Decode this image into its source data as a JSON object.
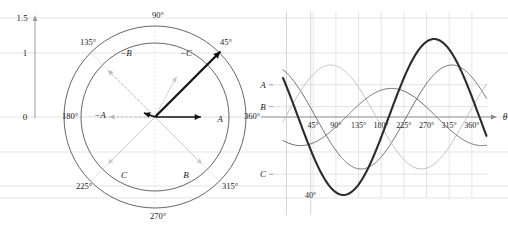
{
  "figure": {
    "title": "",
    "panels": [
      "polar-phasor-diagram",
      "waveform-plot"
    ]
  },
  "colors": {
    "axis": "#9a9a9a",
    "grid": "#d8d8d8",
    "circle": "#555555",
    "phasor_black": "#111111",
    "phasor_grey": "#bdbdbd",
    "phasor_dashed": "#b9b9b9",
    "wave_thick": "#2b2b2b",
    "wave_mid": "#6e6e6e",
    "wave_light": "#c2c2c2",
    "text": "#1a1a1a"
  },
  "left_panel": {
    "name": "polar-phasor-diagram",
    "y_axis_ticks": [
      "1.5",
      "1",
      "0"
    ],
    "angle_labels": [
      "90°",
      "45°",
      "360°",
      "315°",
      "270°",
      "225°",
      "180°",
      "135°"
    ],
    "phasor_labels": [
      "A",
      "−A",
      "B",
      "−B",
      "C",
      "−C"
    ],
    "circles": [
      "outer-circle",
      "inner-circle"
    ]
  },
  "right_panel": {
    "name": "waveform-plot",
    "axis_label": "θ",
    "x_tick_labels": [
      "45°",
      "90°",
      "135°",
      "180°",
      "225°",
      "270°",
      "315°",
      "360°"
    ],
    "level_labels": [
      "A",
      "B",
      "C"
    ],
    "annotation": "40°"
  },
  "chart_data": {
    "type": "line",
    "title": "",
    "xlabel": "θ",
    "ylabel": "",
    "xlim": [
      -15,
      390
    ],
    "ylim": [
      -1.65,
      1.65
    ],
    "grid": true,
    "legend": "none",
    "x_ticks": [
      45,
      90,
      135,
      180,
      225,
      270,
      315,
      360
    ],
    "x_tick_labels": [
      "45°",
      "90°",
      "135°",
      "180°",
      "225°",
      "270°",
      "315°",
      "360°"
    ],
    "y_level_marks": [
      {
        "label": "A",
        "value": 0.62
      },
      {
        "label": "B",
        "value": 0.2
      },
      {
        "label": "C",
        "value": -1.1
      }
    ],
    "annotations": [
      {
        "text": "40°",
        "x": 40,
        "y": -1.55
      }
    ],
    "series": [
      {
        "name": "A",
        "color": "#6e6e6e",
        "width": 1.0,
        "amplitude": 1.0,
        "phase_deg": 40,
        "style": "cos"
      },
      {
        "name": "B",
        "color": "#c2c2c2",
        "width": 1.0,
        "amplitude": 1.0,
        "phase_deg": -80,
        "style": "cos"
      },
      {
        "name": "C",
        "color": "#6e6e6e",
        "width": 1.0,
        "amplitude": 0.55,
        "phase_deg": 160,
        "style": "cos"
      },
      {
        "name": "resultant",
        "color": "#2b2b2b",
        "width": 2.1,
        "amplitude": 1.5,
        "phase_deg": 75,
        "style": "cos"
      }
    ]
  },
  "polar_data": {
    "type": "polar",
    "center": [
      155,
      117
    ],
    "inner_radius": 74,
    "outer_radius": 91,
    "angle_ticks": [
      {
        "label": "360°",
        "angle": 0
      },
      {
        "label": "45°",
        "angle": 45
      },
      {
        "label": "90°",
        "angle": 90
      },
      {
        "label": "135°",
        "angle": 135
      },
      {
        "label": "180°",
        "angle": 180
      },
      {
        "label": "225°",
        "angle": 225
      },
      {
        "label": "270°",
        "angle": 270
      },
      {
        "label": "315°",
        "angle": 315
      }
    ],
    "phasors": [
      {
        "label": "A",
        "angle": 0,
        "magnitude": 0.62,
        "color": "#111111",
        "style": "solid",
        "weight": 1.6
      },
      {
        "label": "−A",
        "angle": 180,
        "magnitude": 0.62,
        "color": "#b9b9b9",
        "style": "dashed",
        "weight": 0.8
      },
      {
        "label": "B",
        "angle": 315,
        "magnitude": 0.9,
        "color": "#c8c8c8",
        "style": "solid",
        "weight": 0.8
      },
      {
        "label": "−B",
        "angle": 135,
        "magnitude": 0.9,
        "color": "#b9b9b9",
        "style": "dashed",
        "weight": 0.8
      },
      {
        "label": "C",
        "angle": 225,
        "magnitude": 0.9,
        "color": "#c8c8c8",
        "style": "solid",
        "weight": 0.8
      },
      {
        "label": "−C",
        "angle": 62,
        "magnitude": 0.62,
        "color": "#c8c8c8",
        "style": "solid",
        "weight": 0.8
      },
      {
        "label": "resultant",
        "angle": 45,
        "magnitude": 1.25,
        "color": "#111111",
        "style": "solid",
        "weight": 2.2
      },
      {
        "label": "small",
        "angle": 160,
        "magnitude": 0.16,
        "color": "#111111",
        "style": "solid",
        "weight": 1.6
      }
    ]
  }
}
